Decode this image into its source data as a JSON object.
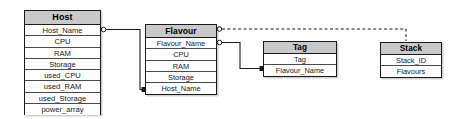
{
  "diagram": {
    "type": "entity-relationship-diagram",
    "background_color": "#ffffff",
    "header_fill": "#c9c9c9",
    "line_color": "#1a1a1a",
    "entities": [
      {
        "id": "host",
        "title": "Host",
        "attributes": [
          "Host_Name",
          "CPU",
          "RAM",
          "Storage",
          "used_CPU",
          "used_RAM",
          "used_Storage",
          "power_array"
        ]
      },
      {
        "id": "flavour",
        "title": "Flavour",
        "attributes": [
          "Flavour_Name",
          "CPU",
          "RAM",
          "Storage",
          "Host_Name"
        ]
      },
      {
        "id": "tag",
        "title": "Tag",
        "attributes": [
          "Tag",
          "Flavour_Name"
        ]
      },
      {
        "id": "stack",
        "title": "Stack",
        "attributes": [
          "Stack_ID",
          "Flavours"
        ]
      }
    ],
    "relationships": [
      {
        "id": "host-to-flavour",
        "from": "Host.Host_Name",
        "to": "Flavour.Host_Name",
        "style": "solid",
        "source_marker": "open-circle",
        "target_marker": "filled-square"
      },
      {
        "id": "flavour-to-tag",
        "from": "Flavour.Flavour_Name",
        "to": "Tag.Flavour_Name",
        "style": "solid",
        "source_marker": "open-circle",
        "target_marker": "filled-square"
      },
      {
        "id": "flavour-to-stack",
        "from": "Flavour",
        "to": "Stack",
        "style": "dashed",
        "source_marker": "open-circle",
        "target_marker": "none"
      }
    ]
  }
}
